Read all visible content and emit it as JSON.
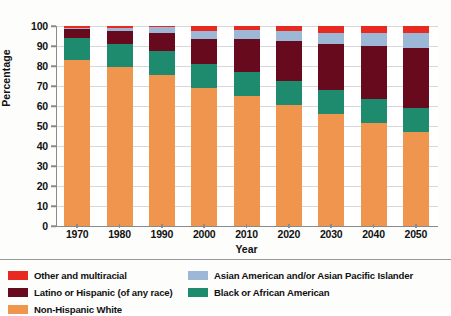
{
  "chart_data": {
    "type": "bar",
    "subtype": "stacked-100-percent",
    "title": "",
    "xlabel": "Year",
    "ylabel": "Percentage",
    "categories": [
      "1970",
      "1980",
      "1990",
      "2000",
      "2010",
      "2020",
      "2030",
      "2040",
      "2050"
    ],
    "ylim": [
      0,
      100
    ],
    "yticks": [
      0,
      10,
      20,
      30,
      40,
      50,
      60,
      70,
      80,
      90,
      100
    ],
    "grid": true,
    "legend_position": "below",
    "stack_order_bottom_to_top": [
      "Non-Hispanic White",
      "Black or African American",
      "Latino or Hispanic (of any race)",
      "Asian American and/or Asian Pacific Islander",
      "Other and multiracial"
    ],
    "series": [
      {
        "name": "Non-Hispanic White",
        "color": "#F0954E",
        "values": [
          83.0,
          79.5,
          75.5,
          69.0,
          65.0,
          60.5,
          56.0,
          51.5,
          47.0
        ]
      },
      {
        "name": "Black or African American",
        "color": "#1E8A6E",
        "values": [
          11.0,
          11.5,
          12.0,
          12.0,
          12.0,
          12.0,
          12.0,
          12.0,
          12.0
        ]
      },
      {
        "name": "Latino or Hispanic (of any race)",
        "color": "#680A1E",
        "values": [
          4.5,
          6.5,
          9.0,
          12.5,
          16.5,
          20.0,
          23.0,
          26.5,
          30.0
        ]
      },
      {
        "name": "Asian American and/or Asian Pacific Islander",
        "color": "#9CB8D6",
        "values": [
          0.7,
          1.5,
          2.8,
          4.0,
          4.5,
          5.0,
          5.5,
          6.5,
          7.5
        ]
      },
      {
        "name": "Other and multiracial",
        "color": "#E8291F",
        "values": [
          0.8,
          1.0,
          0.7,
          2.5,
          2.0,
          2.5,
          3.5,
          3.5,
          3.5
        ]
      }
    ],
    "legend_entries": [
      {
        "label": "Other and multiracial",
        "color": "#E8291F"
      },
      {
        "label": "Asian American and/or Asian Pacific Islander",
        "color": "#9CB8D6"
      },
      {
        "label": "Latino or Hispanic (of any race)",
        "color": "#680A1E"
      },
      {
        "label": "Black or African American",
        "color": "#1E8A6E"
      },
      {
        "label": "Non-Hispanic White",
        "color": "#F0954E"
      }
    ]
  }
}
